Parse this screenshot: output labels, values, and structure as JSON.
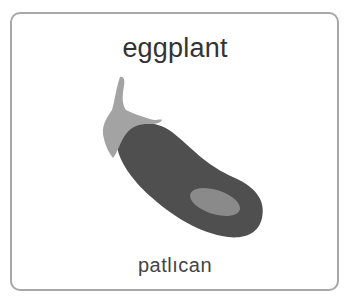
{
  "card": {
    "title": "eggplant",
    "subtitle": "patlıcan"
  },
  "illustration": {
    "subject": "eggplant",
    "icon": "eggplant-icon",
    "colors": {
      "body": "#4f4f4f",
      "highlight": "#8a8a8a",
      "cap": "#a3a3a3",
      "border": "#a8a8a8",
      "title_text": "#333333"
    }
  }
}
